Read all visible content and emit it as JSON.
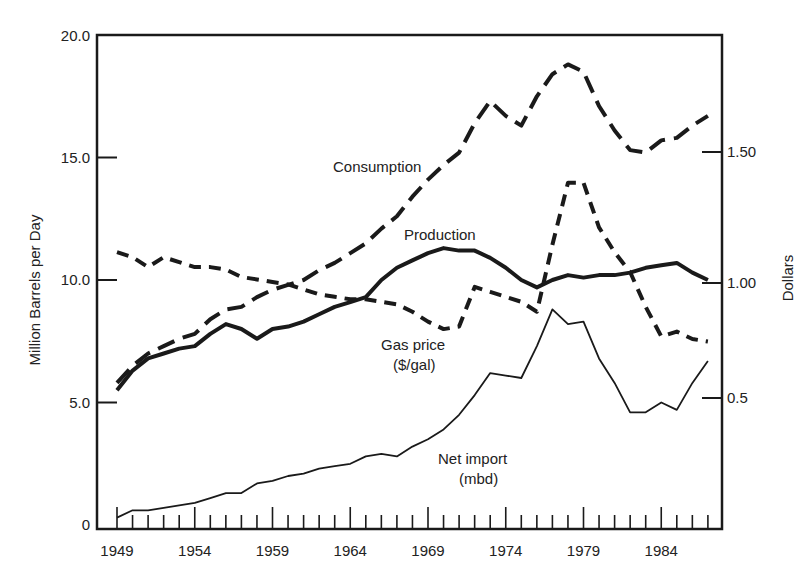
{
  "chart_data": {
    "type": "line",
    "title": "",
    "xlabel": "",
    "ylabel": "Million Barrels per Day",
    "y2label": "Dollars",
    "x": [
      1949,
      1950,
      1951,
      1952,
      1953,
      1954,
      1955,
      1956,
      1957,
      1958,
      1959,
      1960,
      1961,
      1962,
      1963,
      1964,
      1965,
      1966,
      1967,
      1968,
      1969,
      1970,
      1971,
      1972,
      1973,
      1974,
      1975,
      1976,
      1977,
      1978,
      1979,
      1980,
      1981,
      1982,
      1983,
      1984,
      1985,
      1986,
      1987
    ],
    "xticks": [
      "1949",
      "1954",
      "1959",
      "1964",
      "1969",
      "1974",
      "1979",
      "1984"
    ],
    "ylim": [
      0,
      20
    ],
    "yticks": [
      "0",
      "5.0",
      "10.0",
      "15.0",
      "20.0"
    ],
    "y2ticks": [
      "0.5",
      "1.00",
      "1.50"
    ],
    "grid": false,
    "series": [
      {
        "name": "Consumption",
        "axis": "left",
        "style": "long-dash",
        "values": [
          5.8,
          6.5,
          7.0,
          7.3,
          7.6,
          7.8,
          8.4,
          8.8,
          8.9,
          9.3,
          9.6,
          9.8,
          10.0,
          10.4,
          10.7,
          11.1,
          11.5,
          12.1,
          12.6,
          13.4,
          14.1,
          14.7,
          15.2,
          16.4,
          17.3,
          16.7,
          16.3,
          17.5,
          18.4,
          18.8,
          18.5,
          17.1,
          16.1,
          15.3,
          15.2,
          15.7,
          15.8,
          16.3,
          16.7
        ]
      },
      {
        "name": "Production",
        "axis": "left",
        "style": "solid-thick",
        "values": [
          5.5,
          6.3,
          6.8,
          7.0,
          7.2,
          7.3,
          7.8,
          8.2,
          8.0,
          7.6,
          8.0,
          8.1,
          8.3,
          8.6,
          8.9,
          9.1,
          9.3,
          10.0,
          10.5,
          10.8,
          11.1,
          11.3,
          11.2,
          11.2,
          10.9,
          10.5,
          10.0,
          9.7,
          10.0,
          10.2,
          10.1,
          10.2,
          10.2,
          10.3,
          10.5,
          10.6,
          10.7,
          10.3,
          10.0
        ]
      },
      {
        "name": "Gas price ($/gal)",
        "axis": "right",
        "style": "short-dash",
        "values": [
          1.1,
          1.08,
          1.04,
          1.08,
          1.06,
          1.04,
          1.04,
          1.03,
          1.0,
          0.99,
          0.98,
          0.97,
          0.95,
          0.93,
          0.92,
          0.91,
          0.91,
          0.9,
          0.89,
          0.86,
          0.82,
          0.79,
          0.8,
          0.96,
          0.94,
          0.92,
          0.9,
          0.86,
          1.13,
          1.38,
          1.38,
          1.2,
          1.1,
          1.02,
          0.88,
          0.76,
          0.78,
          0.75,
          0.74
        ]
      },
      {
        "name": "Net import (mbd)",
        "axis": "left",
        "style": "solid-thin",
        "values": [
          0.3,
          0.6,
          0.6,
          0.7,
          0.8,
          0.9,
          1.1,
          1.3,
          1.3,
          1.7,
          1.8,
          2.0,
          2.1,
          2.3,
          2.4,
          2.5,
          2.8,
          2.9,
          2.8,
          3.2,
          3.5,
          3.9,
          4.5,
          5.3,
          6.2,
          6.1,
          6.0,
          7.3,
          8.8,
          8.2,
          8.3,
          6.8,
          5.8,
          4.6,
          4.6,
          5.0,
          4.7,
          5.8,
          6.7
        ]
      }
    ],
    "annotations": [
      {
        "text": "Consumption",
        "series": "Consumption"
      },
      {
        "text": "Production",
        "series": "Production"
      },
      {
        "text": "Gas price",
        "series": "Gas price ($/gal)"
      },
      {
        "text": "($/gal)",
        "series": "Gas price ($/gal)"
      },
      {
        "text": "Net import",
        "series": "Net import (mbd)"
      },
      {
        "text": "(mbd)",
        "series": "Net import (mbd)"
      }
    ]
  },
  "labels": {
    "ylabel": "Million Barrels per Day",
    "y2label": "Dollars",
    "consumption": "Consumption",
    "production": "Production",
    "gas_line1": "Gas price",
    "gas_line2": "($/gal)",
    "import_line1": "Net import",
    "import_line2": "(mbd)"
  }
}
